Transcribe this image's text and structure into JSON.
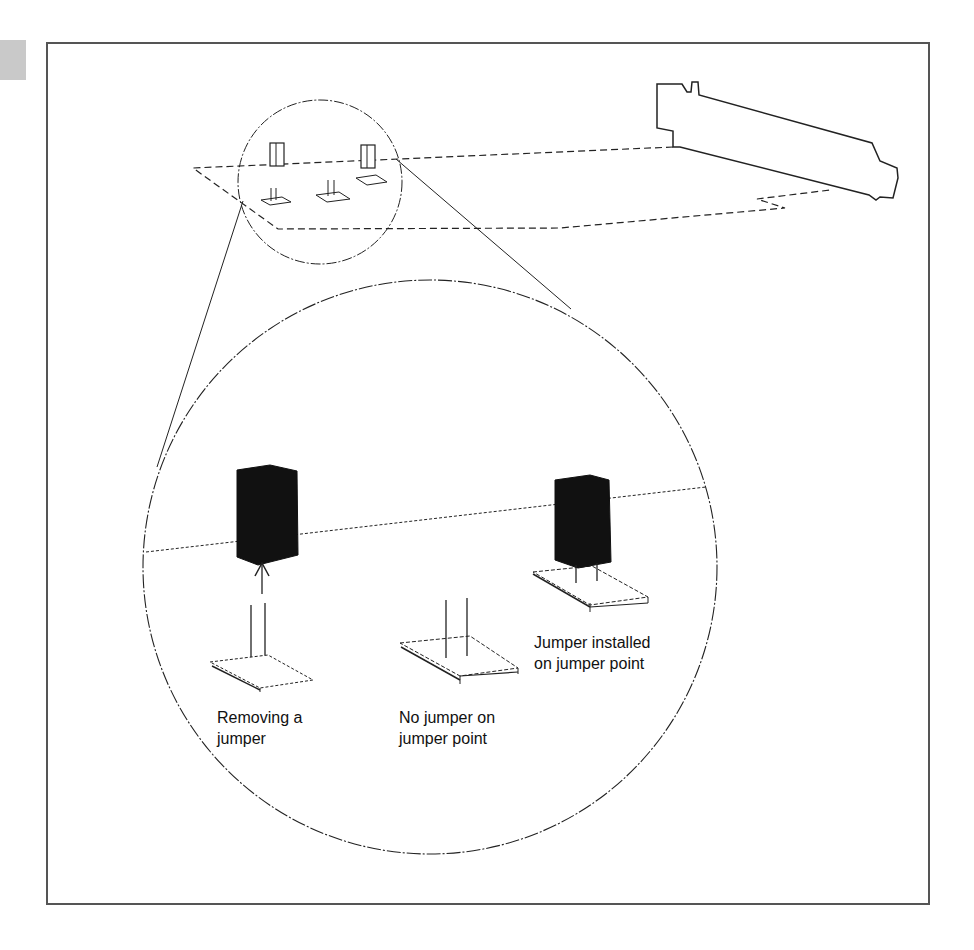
{
  "figure": {
    "labels": {
      "removing": "Removing a\njumper",
      "no_jumper": "No jumper on\njumper point",
      "installed": "Jumper installed\non jumper point"
    },
    "colors": {
      "line": "#222222",
      "jumper_fill": "#111111",
      "frame": "#555555",
      "page_marker": "#c9c9c9"
    }
  }
}
